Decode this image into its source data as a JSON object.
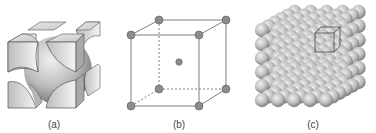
{
  "figure": {
    "panels": [
      {
        "id": "a",
        "label": "(a)",
        "description": "FCC unit cell, hard-sphere cut model"
      },
      {
        "id": "b",
        "label": "(b)",
        "description": "Cubic unit cell, reduced-sphere model with body-center atom"
      },
      {
        "id": "c",
        "label": "(c)",
        "description": "Aggregate of many atoms with unit cell outlined"
      }
    ]
  },
  "colors": {
    "atom_fill": "#8c8c8c",
    "atom_stroke": "#555555",
    "edge": "#6e6e6e",
    "sphere_light": "#e6e6e6",
    "sphere_dark": "#8a8a8a"
  }
}
